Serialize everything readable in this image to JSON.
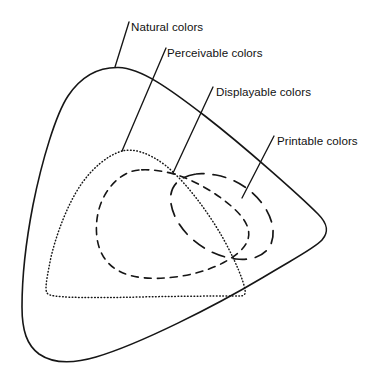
{
  "diagram": {
    "background_color": "#ffffff",
    "stroke_color": "#161616",
    "labels": {
      "natural": "Natural colors",
      "perceivable": "Perceivable colors",
      "displayable": "Displayable colors",
      "printable": "Printable colors"
    },
    "regions": [
      {
        "id": "natural",
        "label": "Natural colors",
        "stroke_style": "solid",
        "description": "Outermost rounded-triangle boundary enclosing all other gamuts",
        "nesting_level": 1
      },
      {
        "id": "perceivable",
        "label": "Perceivable colors",
        "stroke_style": "dotted",
        "description": "Rounded triangle nested inside the natural colors region",
        "nesting_level": 2
      },
      {
        "id": "displayable",
        "label": "Displayable colors",
        "stroke_style": "dashed",
        "description": "Teardrop shape on the left, nested inside perceivable colors",
        "nesting_level": 3
      },
      {
        "id": "printable",
        "label": "Printable colors",
        "stroke_style": "long-dashed",
        "description": "Oval shape on the right overlapping displayable colors",
        "nesting_level": 3
      }
    ],
    "label_positions": {
      "natural": {
        "x": 131,
        "y": 31
      },
      "perceivable": {
        "x": 167,
        "y": 57
      },
      "displayable": {
        "x": 216,
        "y": 96
      },
      "printable": {
        "x": 277,
        "y": 145
      }
    },
    "leader_lines": {
      "natural": {
        "x1": 129,
        "y1": 22,
        "x2": 115,
        "y2": 67
      },
      "perceivable": {
        "x1": 166,
        "y1": 48,
        "x2": 122,
        "y2": 151
      },
      "displayable": {
        "x1": 213,
        "y1": 87,
        "x2": 173,
        "y2": 173
      },
      "printable": {
        "x1": 274,
        "y1": 136,
        "x2": 242,
        "y2": 198
      }
    }
  }
}
